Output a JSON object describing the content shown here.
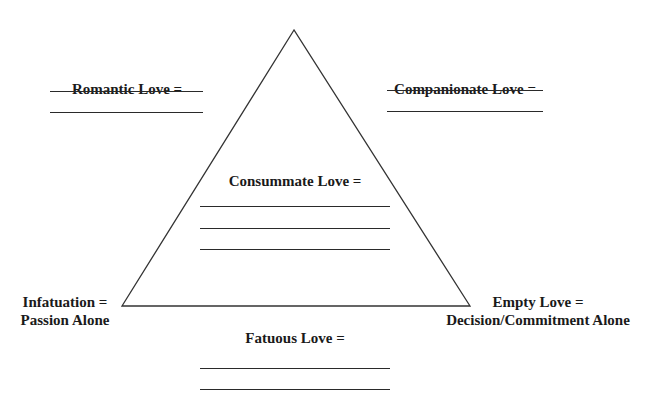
{
  "diagram": {
    "line_color": "#333333",
    "vertices": {
      "top": [
        294,
        30
      ],
      "bottom_left": [
        122,
        306
      ],
      "bottom_right": [
        470,
        306
      ]
    }
  },
  "labels": {
    "romantic": "Romantic Love =",
    "companionate": "Companionate Love =",
    "consummate": "Consummate Love =",
    "infatuation_line1": "Infatuation =",
    "infatuation_line2": "Passion Alone",
    "empty_line1": "Empty Love =",
    "empty_line2": "Decision/Commitment Alone",
    "fatuous": "Fatuous Love ="
  },
  "blanks": {
    "romantic": 2,
    "companionate": 2,
    "consummate": 3,
    "fatuous": 2
  }
}
